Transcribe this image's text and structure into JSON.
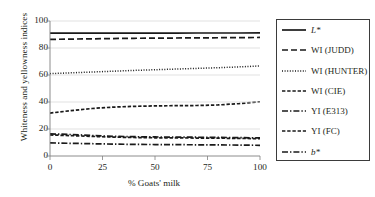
{
  "chart_data": {
    "type": "line",
    "title": "",
    "xlabel": "% Goats' milk",
    "ylabel": "Whiteness and yellowness indices",
    "x": [
      0,
      10,
      20,
      30,
      40,
      50,
      60,
      70,
      80,
      90,
      100
    ],
    "xlim": [
      0,
      100
    ],
    "ylim": [
      0,
      100
    ],
    "xticks": [
      "0",
      "25",
      "50",
      "75",
      "100"
    ],
    "xtick_values": [
      0,
      25,
      50,
      75,
      100
    ],
    "yticks": [
      "0",
      "20",
      "40",
      "60",
      "80",
      "100"
    ],
    "ytick_values": [
      0,
      20,
      40,
      60,
      80,
      100
    ],
    "grid": "horizontal",
    "legend_position": "right-outside",
    "series": [
      {
        "name": "L*",
        "style": "solid",
        "values": [
          91.0,
          91.0,
          91.0,
          91.0,
          91.0,
          91.0,
          91.0,
          91.1,
          91.1,
          91.1,
          91.2
        ]
      },
      {
        "name": "WI (JUDD)",
        "style": "dashed-long",
        "values": [
          86.4,
          86.6,
          86.8,
          87.0,
          87.2,
          87.3,
          87.4,
          87.5,
          87.6,
          87.7,
          87.8
        ]
      },
      {
        "name": "WI (HUNTER)",
        "style": "dotted",
        "values": [
          61.0,
          61.6,
          62.2,
          62.8,
          63.4,
          63.9,
          64.4,
          64.9,
          65.4,
          66.0,
          66.7
        ]
      },
      {
        "name": "WI (CIE)",
        "style": "dashed-short",
        "values": [
          31.8,
          33.6,
          35.2,
          36.2,
          36.8,
          37.1,
          37.3,
          37.4,
          37.8,
          38.8,
          40.2
        ]
      },
      {
        "name": "YI (E313)",
        "style": "dash-dot",
        "values": [
          16.4,
          15.9,
          15.2,
          14.6,
          14.3,
          14.1,
          14.0,
          13.9,
          13.8,
          13.6,
          13.4
        ]
      },
      {
        "name": "YI (FC)",
        "style": "dashed-short",
        "values": [
          15.6,
          15.1,
          14.5,
          14.0,
          13.7,
          13.5,
          13.4,
          13.3,
          13.2,
          13.0,
          12.9
        ]
      },
      {
        "name": "b*",
        "style": "dash-dot",
        "values": [
          9.7,
          9.4,
          9.1,
          8.8,
          8.6,
          8.5,
          8.4,
          8.3,
          8.2,
          8.1,
          7.9
        ]
      }
    ]
  },
  "legend": {
    "items": [
      {
        "label": "L*",
        "italic": true,
        "style": "solid"
      },
      {
        "label": "WI (JUDD)",
        "italic": false,
        "style": "dashed-long"
      },
      {
        "label": "WI (HUNTER)",
        "italic": false,
        "style": "dotted"
      },
      {
        "label": "WI (CIE)",
        "italic": false,
        "style": "dashed-short"
      },
      {
        "label": "YI (E313)",
        "italic": false,
        "style": "dash-dot"
      },
      {
        "label": "YI (FC)",
        "italic": false,
        "style": "dashed-short"
      },
      {
        "label": "b*",
        "italic": true,
        "style": "dash-dot"
      }
    ]
  },
  "colors": {
    "line": "#1a1a1a",
    "grid": "#d9d9d9",
    "axis": "#808080",
    "text": "#231f20",
    "legend_border": "#3b3b3b",
    "background": "#ffffff"
  }
}
